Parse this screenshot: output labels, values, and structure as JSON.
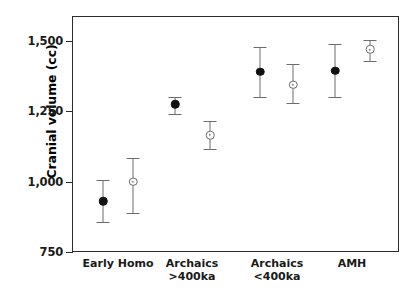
{
  "chart_data": {
    "type": "scatter",
    "title": "",
    "xlabel": "",
    "ylabel": "Cranial volume (cc)",
    "ylim": [
      750,
      1550
    ],
    "yticks": [
      750,
      1000,
      1250,
      1500
    ],
    "ytick_labels": [
      "750",
      "1,000",
      "1,250",
      "1,500"
    ],
    "grid": false,
    "legend": "none",
    "categories": [
      "Early Homo",
      "Archaics\n>400ka",
      "Archaics\n<400ka",
      "AMH"
    ],
    "series": [
      {
        "name": "filled",
        "marker": "filled-circle",
        "values": [
          930,
          1275,
          1390,
          1395
        ],
        "err_low": [
          855,
          1240,
          1300,
          1300
        ],
        "err_high": [
          1005,
          1300,
          1480,
          1490
        ]
      },
      {
        "name": "open",
        "marker": "open-circle",
        "values": [
          1000,
          1165,
          1345,
          1470
        ],
        "err_low": [
          890,
          1115,
          1280,
          1430
        ],
        "err_high": [
          1085,
          1215,
          1420,
          1505
        ]
      }
    ],
    "points": [
      {
        "label": "Early Homo filled",
        "group": 0,
        "series": "filled",
        "x_px": 103,
        "value": 930,
        "low": 855,
        "high": 1005
      },
      {
        "label": "Early Homo open",
        "group": 0,
        "series": "open",
        "x_px": 133,
        "value": 1000,
        "low": 890,
        "high": 1085
      },
      {
        "label": "Archaics >400ka filled",
        "group": 1,
        "series": "filled",
        "x_px": 175,
        "value": 1275,
        "low": 1240,
        "high": 1300
      },
      {
        "label": "Archaics >400ka open",
        "group": 1,
        "series": "open",
        "x_px": 210,
        "value": 1165,
        "low": 1115,
        "high": 1215
      },
      {
        "label": "Archaics <400ka filled",
        "group": 2,
        "series": "filled",
        "x_px": 260,
        "value": 1390,
        "low": 1300,
        "high": 1480
      },
      {
        "label": "Archaics <400ka open",
        "group": 2,
        "series": "open",
        "x_px": 293,
        "value": 1345,
        "low": 1280,
        "high": 1420
      },
      {
        "label": "AMH filled",
        "group": 3,
        "series": "filled",
        "x_px": 335,
        "value": 1395,
        "low": 1300,
        "high": 1490
      },
      {
        "label": "AMH open",
        "group": 3,
        "series": "open",
        "x_px": 370,
        "value": 1470,
        "low": 1430,
        "high": 1505
      }
    ],
    "category_positions_px": [
      118,
      192,
      277,
      352
    ]
  },
  "axis": {
    "y_title": "Cranial volume (cc)",
    "tick_labels": [
      "1,500",
      "1,250",
      "1,000",
      "750"
    ],
    "tick_values": [
      1500,
      1250,
      1000,
      750
    ]
  },
  "xaxis": {
    "labels": [
      {
        "line1": "Early Homo",
        "line2": ""
      },
      {
        "line1": "Archaics",
        "line2": ">400ka"
      },
      {
        "line1": "Archaics",
        "line2": "<400ka"
      },
      {
        "line1": "AMH",
        "line2": ""
      }
    ]
  },
  "colors": {
    "axis": "#2b2b2b",
    "filled_marker": "#111111",
    "open_marker_edge": "#6a6a6a",
    "whisker": "#6d6d6d",
    "background": "#ffffff",
    "text": "#1a1a1a"
  },
  "caption": ""
}
